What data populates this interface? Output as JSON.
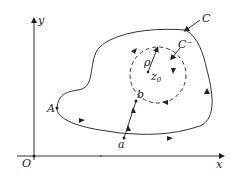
{
  "diagram": {
    "type": "complex-contour-integral",
    "axes": {
      "x_label": "x",
      "y_label": "y",
      "origin_label": "O"
    },
    "contours": {
      "outer": {
        "label": "C",
        "orientation": "counterclockwise"
      },
      "inner": {
        "label": "C⁻",
        "style": "dashed",
        "orientation": "clockwise",
        "center_label": "z",
        "center_subscript": "0",
        "radius_label": "ρ"
      }
    },
    "points": {
      "A": "A",
      "a": "a",
      "b": "b"
    },
    "colors": {
      "stroke": "#333333",
      "text": "#222222",
      "background": "#ffffff"
    }
  }
}
